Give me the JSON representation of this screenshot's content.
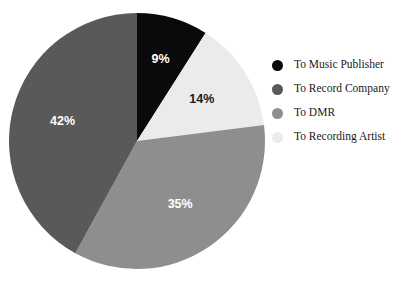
{
  "chart_data": {
    "type": "pie",
    "title": "",
    "subtitle": "",
    "legend_position": "right",
    "grid": false,
    "start_angle_deg": 0,
    "direction": "clockwise",
    "categories": [
      "To Music Publisher",
      "To Recording Artist",
      "To DMR",
      "To Record Company"
    ],
    "values": [
      9,
      14,
      35,
      42
    ],
    "value_unit": "%",
    "colors": [
      "#0a0a0a",
      "#ebebeb",
      "#8e8e8e",
      "#595959"
    ],
    "slices": [
      {
        "label": "To Music Publisher",
        "value": 9,
        "display": "9%",
        "color": "#0a0a0a",
        "label_color": "#ffffff",
        "start_deg": 0,
        "end_deg": 32.4
      },
      {
        "label": "To Recording Artist",
        "value": 14,
        "display": "14%",
        "color": "#ebebeb",
        "label_color": "#1a1a1a",
        "start_deg": 32.4,
        "end_deg": 82.8
      },
      {
        "label": "To DMR",
        "value": 35,
        "display": "35%",
        "color": "#8e8e8e",
        "label_color": "#ffffff",
        "start_deg": 82.8,
        "end_deg": 208.8
      },
      {
        "label": "To Record Company",
        "value": 42,
        "display": "42%",
        "color": "#595959",
        "label_color": "#ffffff",
        "start_deg": 208.8,
        "end_deg": 360
      }
    ]
  },
  "pie": {
    "labels": {
      "music_publisher": "9%",
      "recording_artist": "14%",
      "dmr": "35%",
      "record_company": "42%"
    }
  },
  "legend": {
    "items": [
      {
        "label": "To Music Publisher",
        "color": "#0a0a0a"
      },
      {
        "label": "To Record Company",
        "color": "#595959"
      },
      {
        "label": "To DMR",
        "color": "#8e8e8e"
      },
      {
        "label": "To Recording Artist",
        "color": "#ebebeb"
      }
    ]
  }
}
